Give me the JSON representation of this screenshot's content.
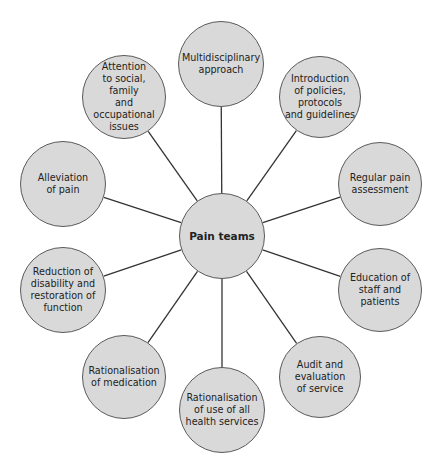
{
  "diagram": {
    "center": {
      "label": "Pain teams",
      "cx": 222,
      "cy": 236,
      "r": 43
    },
    "nodes": [
      {
        "id": "multidisciplinary",
        "label": "Multidisciplinary\napproach",
        "cx": 221,
        "cy": 64,
        "r": 43
      },
      {
        "id": "introduction-policies",
        "label": "Introduction\nof policies,\nprotocols\nand guidelines",
        "cx": 320,
        "cy": 97,
        "r": 41
      },
      {
        "id": "regular-assessment",
        "label": "Regular pain\nassessment",
        "cx": 380,
        "cy": 184,
        "r": 42
      },
      {
        "id": "education",
        "label": "Education of\nstaff and patients",
        "cx": 380,
        "cy": 290,
        "r": 42
      },
      {
        "id": "audit",
        "label": "Audit and\nevaluation\nof service",
        "cx": 320,
        "cy": 377,
        "r": 41
      },
      {
        "id": "rationalisation-services",
        "label": "Rationalisation\nof use of all\nhealth services",
        "cx": 222,
        "cy": 410,
        "r": 43
      },
      {
        "id": "rationalisation-medication",
        "label": "Rationalisation\nof medication",
        "cx": 124,
        "cy": 377,
        "r": 42
      },
      {
        "id": "reduction-disability",
        "label": "Reduction of\ndisability and\nrestoration of\nfunction",
        "cx": 63,
        "cy": 290,
        "r": 43
      },
      {
        "id": "alleviation",
        "label": "Alleviation\nof pain",
        "cx": 63,
        "cy": 184,
        "r": 43
      },
      {
        "id": "attention-social",
        "label": "Attention\nto social, family\nand occupational\nissues",
        "cx": 124,
        "cy": 97,
        "r": 42
      }
    ],
    "colors": {
      "node_fill": "#d9d9d9",
      "node_border": "#5a5a5a",
      "connector": "#333333",
      "text": "#222222",
      "background": "#ffffff"
    }
  }
}
